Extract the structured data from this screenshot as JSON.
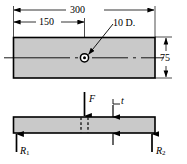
{
  "figure": {
    "type": "engineering-drawing",
    "units_note": "",
    "colors": {
      "part_fill": "#c9c9c9",
      "line": "#000000",
      "background": "#ffffff"
    }
  },
  "plan_view": {
    "name": "plan-view",
    "dimensions": {
      "overall_length": "300",
      "hole_offset": "150",
      "width": "75",
      "hole_callout": "10 D."
    },
    "hole": {
      "label": "10 D.",
      "diameter": "10"
    }
  },
  "elevation_view": {
    "name": "elevation-view",
    "labels": {
      "applied_force": "F",
      "thickness": "t",
      "reaction_left": "R",
      "reaction_left_sub": "1",
      "reaction_right": "R",
      "reaction_right_sub": "2"
    }
  }
}
